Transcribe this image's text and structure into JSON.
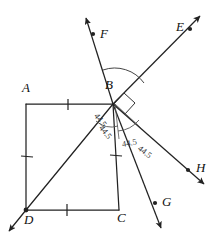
{
  "figure": {
    "type": "geometry-diagram",
    "stroke_color": "#222222",
    "background": "#ffffff"
  },
  "points": {
    "A": {
      "label": "A",
      "x": 22,
      "y": 88
    },
    "B": {
      "label": "B",
      "x": 105,
      "y": 85
    },
    "C": {
      "label": "C",
      "x": 117,
      "y": 218
    },
    "D": {
      "label": "D",
      "x": 24,
      "y": 220
    },
    "E": {
      "label": "E",
      "x": 176,
      "y": 26
    },
    "F": {
      "label": "F",
      "x": 101,
      "y": 33
    },
    "G": {
      "label": "G",
      "x": 162,
      "y": 201
    },
    "H": {
      "label": "H",
      "x": 198,
      "y": 168
    }
  },
  "angles": [
    {
      "value": "44.5",
      "id": "angle-upper-left"
    },
    {
      "value": "44.5",
      "id": "angle-mid-left"
    },
    {
      "value": "44.5",
      "id": "angle-lower-left"
    },
    {
      "value": "44.5",
      "id": "angle-lower-right"
    }
  ],
  "marks": {
    "right_angle": "right-angle-square",
    "arc_major": "arc-F-to-E",
    "tick_count": 4
  }
}
